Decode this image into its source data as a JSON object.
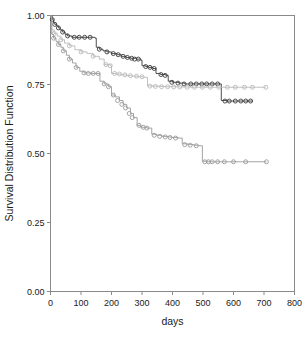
{
  "chart_data": {
    "type": "line",
    "subtype": "kaplan-meier-step",
    "title": "",
    "xlabel": "days",
    "ylabel": "Survival Distribution Function",
    "xlim": [
      0,
      800
    ],
    "ylim": [
      0.0,
      1.0
    ],
    "xticks": [
      0,
      100,
      200,
      300,
      400,
      500,
      600,
      700,
      800
    ],
    "xtick_labels": [
      "0",
      "100",
      "200",
      "300",
      "400",
      "500",
      "600",
      "700",
      "800"
    ],
    "yticks": [
      0.0,
      0.25,
      0.5,
      0.75,
      1.0
    ],
    "ytick_labels": [
      "0.00",
      "0.25",
      "0.50",
      "0.75",
      "1.00"
    ],
    "grid": false,
    "legend": "none",
    "marker": "open-circle",
    "series": [
      {
        "name": "curve-upper",
        "color": "#3b3b3b",
        "points": [
          [
            0,
            1.0
          ],
          [
            6,
            0.985
          ],
          [
            10,
            0.975
          ],
          [
            14,
            0.968
          ],
          [
            20,
            0.962
          ],
          [
            26,
            0.955
          ],
          [
            32,
            0.948
          ],
          [
            40,
            0.94
          ],
          [
            48,
            0.932
          ],
          [
            56,
            0.926
          ],
          [
            70,
            0.921
          ],
          [
            100,
            0.921
          ],
          [
            128,
            0.921
          ],
          [
            146,
            0.918
          ],
          [
            150,
            0.885
          ],
          [
            160,
            0.878
          ],
          [
            172,
            0.872
          ],
          [
            185,
            0.868
          ],
          [
            200,
            0.862
          ],
          [
            218,
            0.858
          ],
          [
            232,
            0.852
          ],
          [
            248,
            0.848
          ],
          [
            262,
            0.845
          ],
          [
            282,
            0.842
          ],
          [
            296,
            0.838
          ],
          [
            300,
            0.818
          ],
          [
            312,
            0.815
          ],
          [
            322,
            0.812
          ],
          [
            336,
            0.808
          ],
          [
            346,
            0.79
          ],
          [
            360,
            0.786
          ],
          [
            378,
            0.783
          ],
          [
            386,
            0.762
          ],
          [
            400,
            0.758
          ],
          [
            420,
            0.755
          ],
          [
            440,
            0.752
          ],
          [
            462,
            0.752
          ],
          [
            480,
            0.752
          ],
          [
            500,
            0.752
          ],
          [
            520,
            0.752
          ],
          [
            540,
            0.752
          ],
          [
            556,
            0.752
          ],
          [
            560,
            0.692
          ],
          [
            578,
            0.69
          ],
          [
            596,
            0.69
          ],
          [
            614,
            0.69
          ],
          [
            632,
            0.69
          ],
          [
            648,
            0.69
          ],
          [
            664,
            0.69
          ]
        ],
        "censored": [
          [
            6,
            0.985
          ],
          [
            14,
            0.968
          ],
          [
            26,
            0.955
          ],
          [
            40,
            0.94
          ],
          [
            56,
            0.926
          ],
          [
            78,
            0.921
          ],
          [
            94,
            0.921
          ],
          [
            112,
            0.921
          ],
          [
            130,
            0.921
          ],
          [
            160,
            0.878
          ],
          [
            185,
            0.868
          ],
          [
            206,
            0.862
          ],
          [
            222,
            0.858
          ],
          [
            238,
            0.852
          ],
          [
            252,
            0.848
          ],
          [
            266,
            0.845
          ],
          [
            276,
            0.842
          ],
          [
            288,
            0.842
          ],
          [
            312,
            0.815
          ],
          [
            326,
            0.812
          ],
          [
            340,
            0.808
          ],
          [
            362,
            0.786
          ],
          [
            376,
            0.783
          ],
          [
            398,
            0.758
          ],
          [
            418,
            0.755
          ],
          [
            438,
            0.752
          ],
          [
            460,
            0.752
          ],
          [
            478,
            0.752
          ],
          [
            496,
            0.752
          ],
          [
            512,
            0.752
          ],
          [
            530,
            0.752
          ],
          [
            548,
            0.752
          ],
          [
            572,
            0.69
          ],
          [
            586,
            0.69
          ],
          [
            606,
            0.69
          ],
          [
            624,
            0.69
          ],
          [
            640,
            0.69
          ],
          [
            656,
            0.69
          ]
        ]
      },
      {
        "name": "curve-middle",
        "color": "#b9b9b9",
        "points": [
          [
            0,
            1.0
          ],
          [
            4,
            0.948
          ],
          [
            12,
            0.935
          ],
          [
            22,
            0.925
          ],
          [
            34,
            0.912
          ],
          [
            46,
            0.9
          ],
          [
            62,
            0.89
          ],
          [
            80,
            0.876
          ],
          [
            100,
            0.868
          ],
          [
            120,
            0.862
          ],
          [
            140,
            0.852
          ],
          [
            160,
            0.842
          ],
          [
            176,
            0.822
          ],
          [
            196,
            0.818
          ],
          [
            200,
            0.79
          ],
          [
            215,
            0.788
          ],
          [
            232,
            0.785
          ],
          [
            250,
            0.782
          ],
          [
            268,
            0.78
          ],
          [
            288,
            0.778
          ],
          [
            306,
            0.776
          ],
          [
            318,
            0.745
          ],
          [
            336,
            0.744
          ],
          [
            356,
            0.743
          ],
          [
            376,
            0.742
          ],
          [
            396,
            0.742
          ],
          [
            416,
            0.741
          ],
          [
            436,
            0.741
          ],
          [
            460,
            0.74
          ],
          [
            484,
            0.74
          ],
          [
            510,
            0.74
          ],
          [
            536,
            0.74
          ],
          [
            562,
            0.74
          ],
          [
            592,
            0.74
          ],
          [
            620,
            0.74
          ],
          [
            650,
            0.74
          ],
          [
            676,
            0.74
          ],
          [
            706,
            0.74
          ]
        ],
        "censored": [
          [
            12,
            0.935
          ],
          [
            34,
            0.912
          ],
          [
            62,
            0.89
          ],
          [
            100,
            0.868
          ],
          [
            140,
            0.852
          ],
          [
            182,
            0.822
          ],
          [
            196,
            0.818
          ],
          [
            210,
            0.79
          ],
          [
            226,
            0.788
          ],
          [
            244,
            0.785
          ],
          [
            262,
            0.782
          ],
          [
            282,
            0.78
          ],
          [
            300,
            0.778
          ],
          [
            326,
            0.744
          ],
          [
            344,
            0.743
          ],
          [
            364,
            0.742
          ],
          [
            384,
            0.742
          ],
          [
            404,
            0.741
          ],
          [
            424,
            0.741
          ],
          [
            448,
            0.74
          ],
          [
            472,
            0.74
          ],
          [
            498,
            0.74
          ],
          [
            524,
            0.74
          ],
          [
            552,
            0.74
          ],
          [
            580,
            0.74
          ],
          [
            606,
            0.74
          ],
          [
            636,
            0.74
          ],
          [
            662,
            0.74
          ],
          [
            706,
            0.74
          ]
        ]
      },
      {
        "name": "curve-lower",
        "color": "#9a9a9a",
        "points": [
          [
            0,
            1.0
          ],
          [
            4,
            0.932
          ],
          [
            10,
            0.918
          ],
          [
            18,
            0.906
          ],
          [
            26,
            0.895
          ],
          [
            34,
            0.885
          ],
          [
            42,
            0.872
          ],
          [
            52,
            0.856
          ],
          [
            62,
            0.842
          ],
          [
            72,
            0.828
          ],
          [
            84,
            0.812
          ],
          [
            96,
            0.798
          ],
          [
            110,
            0.792
          ],
          [
            132,
            0.79
          ],
          [
            150,
            0.79
          ],
          [
            162,
            0.762
          ],
          [
            176,
            0.752
          ],
          [
            190,
            0.742
          ],
          [
            200,
            0.712
          ],
          [
            212,
            0.705
          ],
          [
            226,
            0.692
          ],
          [
            238,
            0.678
          ],
          [
            250,
            0.665
          ],
          [
            262,
            0.645
          ],
          [
            272,
            0.63
          ],
          [
            284,
            0.602
          ],
          [
            296,
            0.595
          ],
          [
            316,
            0.592
          ],
          [
            332,
            0.57
          ],
          [
            348,
            0.566
          ],
          [
            366,
            0.562
          ],
          [
            384,
            0.56
          ],
          [
            398,
            0.558
          ],
          [
            418,
            0.556
          ],
          [
            432,
            0.535
          ],
          [
            450,
            0.532
          ],
          [
            470,
            0.53
          ],
          [
            486,
            0.528
          ],
          [
            498,
            0.472
          ],
          [
            514,
            0.47
          ],
          [
            534,
            0.47
          ],
          [
            556,
            0.47
          ],
          [
            578,
            0.47
          ],
          [
            604,
            0.47
          ],
          [
            640,
            0.47
          ],
          [
            708,
            0.47
          ]
        ],
        "censored": [
          [
            10,
            0.918
          ],
          [
            26,
            0.895
          ],
          [
            42,
            0.872
          ],
          [
            62,
            0.842
          ],
          [
            84,
            0.812
          ],
          [
            110,
            0.792
          ],
          [
            124,
            0.79
          ],
          [
            140,
            0.79
          ],
          [
            156,
            0.79
          ],
          [
            176,
            0.752
          ],
          [
            190,
            0.742
          ],
          [
            206,
            0.712
          ],
          [
            220,
            0.692
          ],
          [
            234,
            0.678
          ],
          [
            246,
            0.665
          ],
          [
            258,
            0.645
          ],
          [
            268,
            0.63
          ],
          [
            290,
            0.602
          ],
          [
            304,
            0.595
          ],
          [
            316,
            0.592
          ],
          [
            340,
            0.566
          ],
          [
            358,
            0.562
          ],
          [
            376,
            0.56
          ],
          [
            392,
            0.558
          ],
          [
            410,
            0.556
          ],
          [
            440,
            0.532
          ],
          [
            458,
            0.53
          ],
          [
            478,
            0.528
          ],
          [
            506,
            0.47
          ],
          [
            518,
            0.47
          ],
          [
            530,
            0.47
          ],
          [
            548,
            0.47
          ],
          [
            570,
            0.47
          ],
          [
            600,
            0.47
          ],
          [
            640,
            0.47
          ],
          [
            708,
            0.47
          ]
        ]
      }
    ]
  },
  "axes": {
    "x_title": "days",
    "y_title": "Survival Distribution Function"
  },
  "colors": {
    "frame": "#8a8a8a",
    "text": "#1a1a1a",
    "series_upper": "#3b3b3b",
    "series_middle": "#b9b9b9",
    "series_lower": "#9a9a9a",
    "background": "#ffffff"
  }
}
